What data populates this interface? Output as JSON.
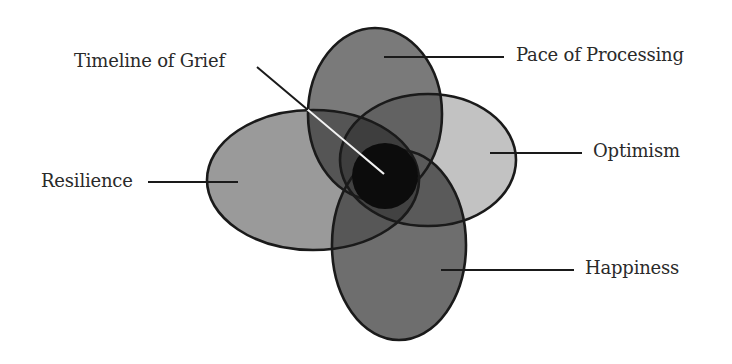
{
  "diagram": {
    "type": "overlapping-ellipses",
    "colors": {
      "background": "#ffffff",
      "outline": "#1a1a1a",
      "leader_line": "#1a1a1a",
      "leader_line_inside": "#ffffff",
      "text": "#2a2a2a"
    },
    "center": {
      "label": "Timeline of Grief",
      "fill": "#0c0c0c"
    },
    "petals": [
      {
        "id": "pace",
        "label": "Pace of Processing",
        "position": "top",
        "fill": "#7a7a7a"
      },
      {
        "id": "optimism",
        "label": "Optimism",
        "position": "right",
        "fill": "#c2c2c2"
      },
      {
        "id": "resilience",
        "label": "Resilience",
        "position": "left",
        "fill": "#9a9a9a"
      },
      {
        "id": "happiness",
        "label": "Happiness",
        "position": "bottom",
        "fill": "#6e6e6e"
      }
    ]
  }
}
